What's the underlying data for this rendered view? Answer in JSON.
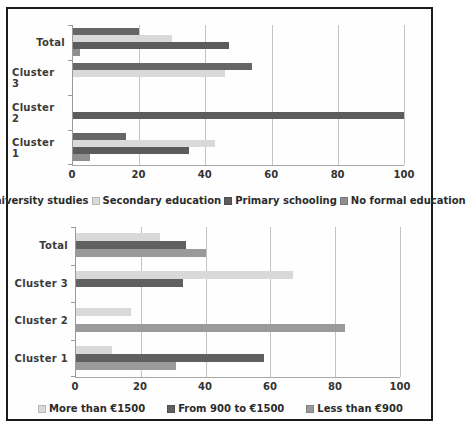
{
  "figure": {
    "border_color": "#1b1b1b",
    "background": "#fefefe"
  },
  "chart_data": [
    {
      "type": "bar",
      "orientation": "horizontal",
      "title": "",
      "categories": [
        "Total",
        "Cluster 3",
        "Cluster 2",
        "Cluster 1"
      ],
      "series": [
        {
          "name": "University studies",
          "color": "#666666",
          "values": [
            20,
            54,
            0,
            16
          ]
        },
        {
          "name": "Secondary education",
          "color": "#d9d9d9",
          "values": [
            30,
            46,
            0,
            43
          ]
        },
        {
          "name": "Primary schooling",
          "color": "#5c5c5c",
          "values": [
            47,
            0,
            100,
            35
          ]
        },
        {
          "name": "No formal education",
          "color": "#8f8f8f",
          "values": [
            2,
            0,
            0,
            5
          ]
        }
      ],
      "xlim": [
        0,
        100
      ],
      "xticks": [
        0,
        20,
        40,
        60,
        80,
        100
      ],
      "grid": true,
      "legend_position": "bottom"
    },
    {
      "type": "bar",
      "orientation": "horizontal",
      "title": "",
      "categories": [
        "Total",
        "Cluster 3",
        "Cluster 2",
        "Cluster 1"
      ],
      "series": [
        {
          "name": "More than €1500",
          "color": "#d9d9d9",
          "values": [
            26,
            67,
            17,
            11
          ]
        },
        {
          "name": "From 900 to €1500",
          "color": "#606060",
          "values": [
            34,
            33,
            0,
            58
          ]
        },
        {
          "name": "Less than €900",
          "color": "#9a9a9a",
          "values": [
            40,
            0,
            83,
            31
          ]
        }
      ],
      "xlim": [
        0,
        100
      ],
      "xticks": [
        0,
        20,
        40,
        60,
        80,
        100
      ],
      "grid": true,
      "legend_position": "bottom"
    }
  ]
}
